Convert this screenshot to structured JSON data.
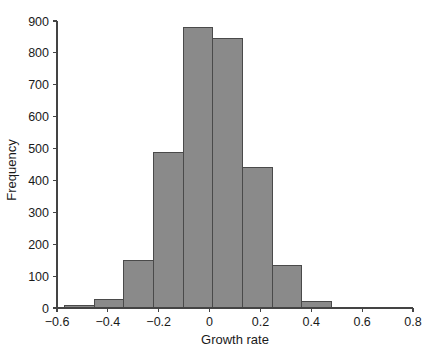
{
  "chart_data": {
    "type": "bar",
    "title": "",
    "subtitle": "",
    "xlabel": "Growth rate",
    "ylabel": "Frequency",
    "xlim": [
      -0.6,
      0.8
    ],
    "ylim": [
      0,
      900
    ],
    "grid": false,
    "legend": null,
    "bar_color": "#8a8a8a",
    "bar_edge_color": "#4a4a4a",
    "axis_color": "#444444",
    "bin_edges": [
      -0.57,
      -0.4533,
      -0.3367,
      -0.22,
      -0.1033,
      0.0133,
      0.13,
      0.2467,
      0.3633,
      0.48,
      0.5967,
      0.7133,
      0.83
    ],
    "categories": [
      "-0.570 to -0.453",
      "-0.453 to -0.337",
      "-0.337 to -0.220",
      "-0.220 to -0.103",
      "-0.103 to 0.013",
      "0.013 to 0.130",
      "0.130 to 0.247",
      "0.247 to 0.363",
      "0.363 to 0.480",
      "0.480 to 0.597",
      "0.597 to 0.713",
      "0.713 to 0.830"
    ],
    "values": [
      8,
      28,
      150,
      487,
      880,
      845,
      440,
      132,
      20,
      3,
      2,
      0
    ],
    "xticks": [
      -0.6,
      -0.4,
      -0.2,
      0,
      0.2,
      0.4,
      0.6,
      0.8
    ],
    "xticklabels": [
      "−0.6",
      "−0.4",
      "−0.2",
      "0",
      "0.2",
      "0.4",
      "0.6",
      "0.8"
    ],
    "yticks": [
      0,
      100,
      200,
      300,
      400,
      500,
      600,
      700,
      800,
      900
    ],
    "yticklabels": [
      "0",
      "100",
      "200",
      "300",
      "400",
      "500",
      "600",
      "700",
      "800",
      "900"
    ]
  },
  "axes": {
    "x_title": "Growth rate",
    "y_title": "Frequency"
  }
}
